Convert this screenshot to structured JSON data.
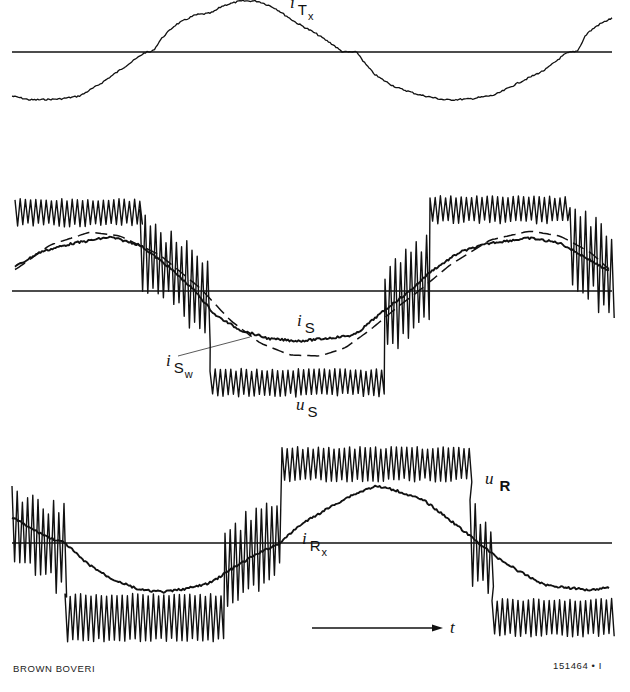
{
  "footer": {
    "left": "BROWN BOVERI",
    "right": "151464 • I"
  },
  "labels": {
    "iTx": {
      "var": "i",
      "sub": "T",
      "sub2": "x"
    },
    "iS": {
      "var": "i",
      "sub": "S"
    },
    "iSw": {
      "var": "i",
      "sub": "S",
      "sub2": "w"
    },
    "uS": {
      "var": "u",
      "sub": "S"
    },
    "uR": {
      "var": "u",
      "sub": "R"
    },
    "iRx": {
      "var": "i",
      "sub": "R",
      "sub2": "x"
    },
    "time": {
      "var": "t"
    }
  },
  "colors": {
    "ink": "#111111",
    "background": "#ffffff"
  },
  "chart_data": [
    {
      "type": "line",
      "title": "",
      "panel": "top",
      "xlabel": "",
      "ylabel": "",
      "grid": false,
      "axis_baseline_px": 52,
      "x_range_px": [
        12,
        612
      ],
      "series": [
        {
          "name": "i_Tx",
          "style": "solid-thin-noisy",
          "points_px": [
            [
              12,
              96
            ],
            [
              30,
              100
            ],
            [
              60,
              99
            ],
            [
              80,
              96
            ],
            [
              100,
              84
            ],
            [
              120,
              70
            ],
            [
              140,
              56
            ],
            [
              145,
              52
            ],
            [
              153,
              52
            ],
            [
              160,
              40
            ],
            [
              175,
              25
            ],
            [
              195,
              15
            ],
            [
              212,
              13
            ],
            [
              222,
              6
            ],
            [
              240,
              1
            ],
            [
              258,
              1
            ],
            [
              275,
              8
            ],
            [
              295,
              22
            ],
            [
              315,
              33
            ],
            [
              335,
              46
            ],
            [
              342,
              52
            ],
            [
              358,
              52
            ],
            [
              362,
              60
            ],
            [
              375,
              75
            ],
            [
              395,
              87
            ],
            [
              420,
              95
            ],
            [
              445,
              100
            ],
            [
              470,
              99
            ],
            [
              495,
              95
            ],
            [
              520,
              82
            ],
            [
              545,
              70
            ],
            [
              565,
              54
            ],
            [
              570,
              52
            ],
            [
              578,
              52
            ],
            [
              585,
              35
            ],
            [
              598,
              25
            ],
            [
              612,
              18
            ]
          ]
        }
      ]
    },
    {
      "type": "line",
      "title": "",
      "panel": "middle",
      "xlabel": "",
      "ylabel": "",
      "grid": false,
      "axis_baseline_px": 291,
      "x_range_px": [
        12,
        612
      ],
      "series": [
        {
          "name": "u_S",
          "style": "pwm-square-wave",
          "description": "PWM stator voltage: high band ~y200-225 for x 15-140, transitions to low band ~y375-395 for x 210-385, back to high band for x 430-570",
          "segments": [
            {
              "x": [
                15,
                140
              ],
              "level": "high",
              "top_px": 200,
              "bottom_px": 225
            },
            {
              "x": [
                140,
                210
              ],
              "level": "transition-down"
            },
            {
              "x": [
                210,
                385
              ],
              "level": "low",
              "top_px": 370,
              "bottom_px": 395
            },
            {
              "x": [
                385,
                430
              ],
              "level": "transition-up"
            },
            {
              "x": [
                430,
                570
              ],
              "level": "high",
              "top_px": 197,
              "bottom_px": 222
            },
            {
              "x": [
                570,
                612
              ],
              "level": "transition-down"
            }
          ]
        },
        {
          "name": "i_S",
          "style": "solid-thick-noisy",
          "points_px": [
            [
              15,
              267
            ],
            [
              40,
              252
            ],
            [
              70,
              244
            ],
            [
              110,
              237
            ],
            [
              140,
              245
            ],
            [
              170,
              268
            ],
            [
              195,
              291
            ],
            [
              215,
              315
            ],
            [
              240,
              330
            ],
            [
              270,
              339
            ],
            [
              300,
              341
            ],
            [
              330,
              338
            ],
            [
              355,
              335
            ],
            [
              375,
              318
            ],
            [
              395,
              302
            ],
            [
              410,
              291
            ],
            [
              430,
              272
            ],
            [
              460,
              252
            ],
            [
              490,
              243
            ],
            [
              530,
              238
            ],
            [
              560,
              243
            ],
            [
              590,
              260
            ],
            [
              610,
              272
            ]
          ]
        },
        {
          "name": "i_Sw",
          "style": "dashed",
          "points_px": [
            [
              15,
              270
            ],
            [
              50,
              245
            ],
            [
              90,
              232
            ],
            [
              120,
              236
            ],
            [
              160,
              255
            ],
            [
              200,
              288
            ],
            [
              230,
              320
            ],
            [
              260,
              343
            ],
            [
              290,
              355
            ],
            [
              320,
              356
            ],
            [
              345,
              348
            ],
            [
              370,
              330
            ],
            [
              400,
              305
            ],
            [
              420,
              290
            ],
            [
              450,
              265
            ],
            [
              490,
              240
            ],
            [
              530,
              231
            ],
            [
              560,
              236
            ],
            [
              590,
              252
            ],
            [
              610,
              270
            ]
          ]
        }
      ]
    },
    {
      "type": "line",
      "title": "",
      "panel": "bottom",
      "xlabel": "t",
      "ylabel": "",
      "grid": false,
      "axis_baseline_px": 543,
      "x_range_px": [
        12,
        612
      ],
      "series": [
        {
          "name": "u_R",
          "style": "pwm-square-wave",
          "description": "PWM rotor voltage: decaying from top-left to axis near x~65, low band ~y600-640 for x 70-225, transition x 225-282, high band ~y450-480 for x 282-470, transition back to low band ~y600-635 x 490-612",
          "segments": [
            {
              "x": [
                12,
                65
              ],
              "level": "transition-down"
            },
            {
              "x": [
                65,
                225
              ],
              "level": "low",
              "top_px": 595,
              "bottom_px": 640
            },
            {
              "x": [
                225,
                282
              ],
              "level": "transition-up"
            },
            {
              "x": [
                282,
                470
              ],
              "level": "high",
              "top_px": 448,
              "bottom_px": 480
            },
            {
              "x": [
                470,
                492
              ],
              "level": "transition-down"
            },
            {
              "x": [
                492,
                612
              ],
              "level": "low",
              "top_px": 600,
              "bottom_px": 635
            }
          ]
        },
        {
          "name": "i_Rx",
          "style": "solid-thick-noisy",
          "points_px": [
            [
              12,
              517
            ],
            [
              30,
              528
            ],
            [
              50,
              538
            ],
            [
              65,
              543
            ],
            [
              85,
              562
            ],
            [
              110,
              578
            ],
            [
              140,
              590
            ],
            [
              165,
              592
            ],
            [
              190,
              588
            ],
            [
              210,
              583
            ],
            [
              230,
              570
            ],
            [
              255,
              555
            ],
            [
              280,
              543
            ],
            [
              300,
              525
            ],
            [
              325,
              510
            ],
            [
              350,
              496
            ],
            [
              375,
              486
            ],
            [
              395,
              490
            ],
            [
              425,
              501
            ],
            [
              450,
              520
            ],
            [
              475,
              540
            ],
            [
              495,
              556
            ],
            [
              520,
              572
            ],
            [
              545,
              585
            ],
            [
              570,
              588
            ],
            [
              590,
              590
            ],
            [
              610,
              587
            ]
          ]
        }
      ]
    }
  ]
}
